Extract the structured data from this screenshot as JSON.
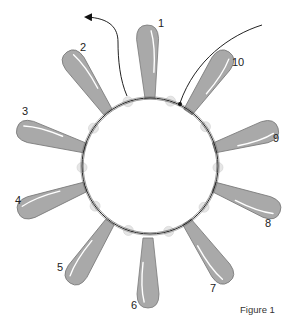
{
  "figure": {
    "caption": "Figure 1",
    "colors": {
      "petal_fill": "#a9a9a9",
      "petal_edge": "#7a7a7a",
      "petal_highlight": "#ffffff",
      "wire": "#222222",
      "seed_bead": "#e6e6e6"
    },
    "ring": {
      "cx": 150,
      "cy": 166,
      "r": 68
    },
    "petals": [
      {
        "label": "1",
        "base": [
          150,
          98
        ],
        "tip": [
          147,
          25
        ],
        "label_pos": [
          158,
          18
        ]
      },
      {
        "label": "2",
        "base": [
          108,
          112
        ],
        "tip": [
          67,
          52
        ],
        "label_pos": [
          80,
          42
        ]
      },
      {
        "label": "3",
        "base": [
          85,
          148
        ],
        "tip": [
          17,
          128
        ],
        "label_pos": [
          22,
          106
        ]
      },
      {
        "label": "4",
        "base": [
          85,
          187
        ],
        "tip": [
          18,
          212
        ],
        "label_pos": [
          15,
          195
        ]
      },
      {
        "label": "5",
        "base": [
          110,
          222
        ],
        "tip": [
          70,
          283
        ],
        "label_pos": [
          57,
          262
        ]
      },
      {
        "label": "6",
        "base": [
          148,
          238
        ],
        "tip": [
          148,
          308
        ],
        "label_pos": [
          131,
          300
        ]
      },
      {
        "label": "7",
        "base": [
          187,
          222
        ],
        "tip": [
          229,
          282
        ],
        "label_pos": [
          210,
          283
        ]
      },
      {
        "label": "8",
        "base": [
          214,
          187
        ],
        "tip": [
          280,
          212
        ],
        "label_pos": [
          265,
          218
        ]
      },
      {
        "label": "9",
        "base": [
          214,
          148
        ],
        "tip": [
          278,
          128
        ],
        "label_pos": [
          273,
          133
        ]
      },
      {
        "label": "10",
        "base": [
          188,
          112
        ],
        "tip": [
          229,
          52
        ],
        "label_pos": [
          232,
          57
        ]
      }
    ],
    "arrows": [
      {
        "name": "wire-exit-arrow",
        "direction": "left"
      },
      {
        "name": "wire-entry-arrow",
        "direction": "into-ring"
      }
    ]
  }
}
